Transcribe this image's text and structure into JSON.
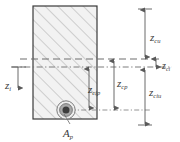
{
  "figure": {
    "kind": "engineering-cross-section",
    "colors": {
      "line": "#3a3a3a",
      "hatch": "#9a9a9a",
      "section_fill": "#f2f2f2",
      "tendon_core": "#3c3c3c",
      "tendon_ring": "#a8a8a8",
      "tendon_outline": "#4a4a4a",
      "dim_line": "#6e6e6e",
      "text": "#3a3a3a"
    }
  },
  "section": {
    "name": "concrete-section",
    "x": 33,
    "y": 6,
    "width": 64,
    "height": 113
  },
  "tendon": {
    "label": "A",
    "subscript": "p",
    "cx": 66,
    "cy": 110,
    "r_outer": 9.5,
    "r_ring": 6.5,
    "r_core": 3.6
  },
  "reference_lines": {
    "centroid_dashed": {
      "name": "concrete-centroid-axis",
      "y": 59,
      "style": "dashed"
    },
    "ideal_dashdot": {
      "name": "ideal-section-axis",
      "y": 67,
      "style": "dash-dot"
    },
    "tendon_dashdot": {
      "name": "tendon-level-axis",
      "y": 110,
      "style": "dash-dot"
    }
  },
  "dimensions": [
    {
      "name": "z-cu",
      "label": "z",
      "subscript": "cu",
      "x": 150,
      "y": 36,
      "from_y": 8,
      "to_y": 63,
      "axis_x": 145
    },
    {
      "name": "z-ci",
      "label": "z",
      "subscript": "ci",
      "x": 163,
      "y": 62,
      "from_y": 59,
      "to_y": 67,
      "axis_x": 155
    },
    {
      "name": "z-ciu",
      "label": "z",
      "subscript": "ciu",
      "x": 150,
      "y": 90,
      "from_y": 70,
      "to_y": 126,
      "axis_x": 145
    },
    {
      "name": "z-cp",
      "label": "z",
      "subscript": "cp",
      "x": 120,
      "y": 80,
      "from_y": 59,
      "to_y": 110,
      "axis_x": 114
    },
    {
      "name": "z-cip",
      "label": "z",
      "subscript": "cip",
      "x": 91,
      "y": 86,
      "from_y": 67,
      "to_y": 110,
      "axis_x": 89
    },
    {
      "name": "z-i",
      "label": "z",
      "subscript": "i",
      "x": 5,
      "y": 82,
      "from_y": 67,
      "to_y": 88,
      "axis_x": 18
    }
  ],
  "callout": {
    "name": "tendon-area-callout",
    "label": "A",
    "subscript": "p",
    "x": 62,
    "y": 126,
    "leader": {
      "x1": 70,
      "y1": 122,
      "x2": 63,
      "y2": 113
    }
  }
}
